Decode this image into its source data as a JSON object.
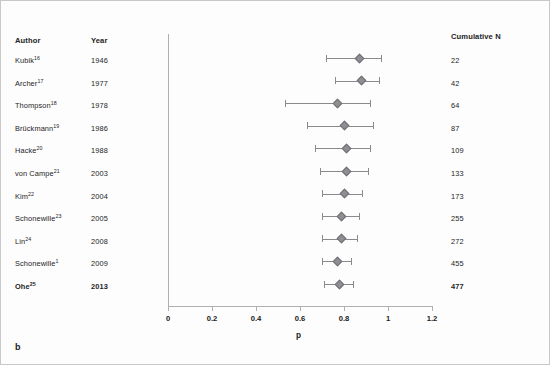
{
  "panel": {
    "label": "b"
  },
  "columns": {
    "author": "Author",
    "year": "Year",
    "cumulative_n": "Cumulative N"
  },
  "chart_data": {
    "type": "scatter",
    "title": "",
    "xlabel": "p",
    "ylabel": "",
    "xlim": [
      0,
      1.2
    ],
    "xticks": [
      0,
      0.2,
      0.4,
      0.6,
      0.8,
      1,
      1.2
    ],
    "xticklabels": [
      "0",
      "0.2",
      "0.4",
      "0.6",
      "0.8",
      "1",
      "1.2"
    ],
    "grid": false,
    "legend": false,
    "marker_color": "#8f8f93",
    "line_color": "#8a8a8a",
    "rows": [
      {
        "author": "Kubik",
        "ref": "16",
        "year": "1946",
        "cumulative_n": "22",
        "p": 0.87,
        "ci_low": 0.72,
        "ci_high": 0.97,
        "bold": false
      },
      {
        "author": "Archer",
        "ref": "17",
        "year": "1977",
        "cumulative_n": "42",
        "p": 0.88,
        "ci_low": 0.76,
        "ci_high": 0.96,
        "bold": false
      },
      {
        "author": "Thompson",
        "ref": "18",
        "year": "1978",
        "cumulative_n": "64",
        "p": 0.77,
        "ci_low": 0.53,
        "ci_high": 0.92,
        "bold": false
      },
      {
        "author": "Brückmann",
        "ref": "19",
        "year": "1986",
        "cumulative_n": "87",
        "p": 0.8,
        "ci_low": 0.63,
        "ci_high": 0.93,
        "bold": false
      },
      {
        "author": "Hacke",
        "ref": "20",
        "year": "1988",
        "cumulative_n": "109",
        "p": 0.81,
        "ci_low": 0.67,
        "ci_high": 0.92,
        "bold": false
      },
      {
        "author": "von Campe",
        "ref": "21",
        "year": "2003",
        "cumulative_n": "133",
        "p": 0.81,
        "ci_low": 0.69,
        "ci_high": 0.91,
        "bold": false
      },
      {
        "author": "Kim",
        "ref": "22",
        "year": "2004",
        "cumulative_n": "173",
        "p": 0.8,
        "ci_low": 0.7,
        "ci_high": 0.88,
        "bold": false
      },
      {
        "author": "Schonewille",
        "ref": "23",
        "year": "2005",
        "cumulative_n": "255",
        "p": 0.79,
        "ci_low": 0.7,
        "ci_high": 0.87,
        "bold": false
      },
      {
        "author": "Lin",
        "ref": "24",
        "year": "2008",
        "cumulative_n": "272",
        "p": 0.79,
        "ci_low": 0.7,
        "ci_high": 0.86,
        "bold": false
      },
      {
        "author": "Schonewille",
        "ref": "1",
        "year": "2009",
        "cumulative_n": "455",
        "p": 0.77,
        "ci_low": 0.7,
        "ci_high": 0.83,
        "bold": false
      },
      {
        "author": "Ohe",
        "ref": "25",
        "year": "2013",
        "cumulative_n": "477",
        "p": 0.78,
        "ci_low": 0.71,
        "ci_high": 0.84,
        "bold": true
      }
    ]
  }
}
